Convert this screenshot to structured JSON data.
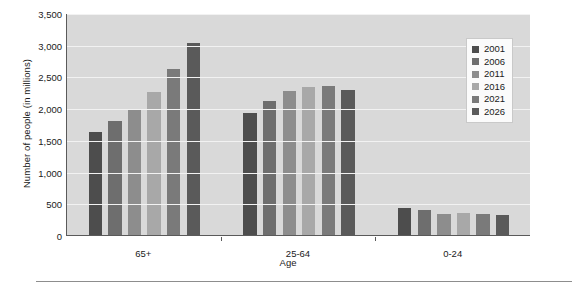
{
  "chart_data": {
    "type": "bar",
    "title": "",
    "xlabel": "Age",
    "ylabel": "Number of people (in millions)",
    "categories": [
      "65+",
      "25-64",
      "0-24"
    ],
    "ylim": [
      0,
      3500
    ],
    "ytick_step": 500,
    "ytick_labels": [
      "0",
      "500",
      "1,000",
      "1,500",
      "2,000",
      "2,500",
      "3,000",
      "3,500"
    ],
    "grid": true,
    "legend_position": "top-right",
    "series": [
      {
        "name": "2001",
        "color": "#4d4d4d",
        "values": [
          1625,
          1930,
          420
        ]
      },
      {
        "name": "2006",
        "color": "#6e6e6e",
        "values": [
          1790,
          2120,
          390
        ]
      },
      {
        "name": "2011",
        "color": "#8d8d8d",
        "values": [
          1985,
          2270,
          330
        ]
      },
      {
        "name": "2016",
        "color": "#a8a8a8",
        "values": [
          2250,
          2335,
          340
        ]
      },
      {
        "name": "2021",
        "color": "#7a7a7a",
        "values": [
          2615,
          2350,
          325
        ]
      },
      {
        "name": "2026",
        "color": "#5a5a5a",
        "values": [
          3020,
          2290,
          310
        ]
      }
    ]
  },
  "legend": {
    "items": [
      {
        "label": "2001"
      },
      {
        "label": "2006"
      },
      {
        "label": "2011"
      },
      {
        "label": "2016"
      },
      {
        "label": "2021"
      },
      {
        "label": "2026"
      }
    ]
  },
  "axes": {
    "y_title": "Number of people (in millions)",
    "x_title": "Age"
  },
  "colors": {
    "plot_background": "#d9d9d9",
    "gridline": "#f2f2f2",
    "axis": "#5a5a5a",
    "page_background": "#ffffff",
    "footer_rule": "#8d8d8d"
  }
}
